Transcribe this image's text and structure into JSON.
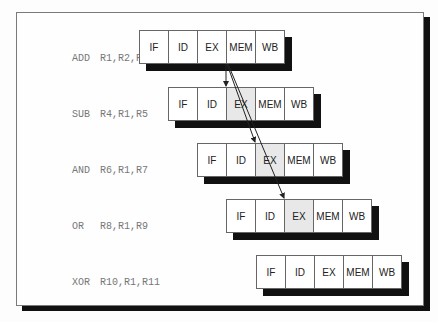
{
  "diagram": {
    "title": "",
    "stage_labels": [
      "IF",
      "ID",
      "EX",
      "MEM",
      "WB"
    ],
    "instructions": [
      {
        "op": "ADD",
        "operands": "R1,R2,R3",
        "stages": [
          "IF",
          "ID",
          "EX",
          "MEM",
          "WB"
        ],
        "highlight": null
      },
      {
        "op": "SUB",
        "operands": "R4,R1,R5",
        "stages": [
          "IF",
          "ID",
          "EX",
          "MEM",
          "WB"
        ],
        "highlight": "EX"
      },
      {
        "op": "AND",
        "operands": "R6,R1,R7",
        "stages": [
          "IF",
          "ID",
          "EX",
          "MEM",
          "WB"
        ],
        "highlight": "EX"
      },
      {
        "op": "OR",
        "operands": "R8,R1,R9",
        "stages": [
          "IF",
          "ID",
          "EX",
          "MEM",
          "WB"
        ],
        "highlight": "EX"
      },
      {
        "op": "XOR",
        "operands": "R10,R1,R11",
        "stages": [
          "IF",
          "ID",
          "EX",
          "MEM",
          "WB"
        ],
        "highlight": null
      }
    ],
    "forwarding_arrows": [
      {
        "from": "ADD.EX/MEM",
        "to": "SUB.EX"
      },
      {
        "from": "ADD.EX/MEM",
        "to": "AND.EX"
      },
      {
        "from": "ADD.EX/MEM",
        "to": "OR.EX"
      }
    ],
    "colors": {
      "highlight": "#e8e8e8",
      "shadow": "#111111",
      "border": "#666666",
      "label_text": "#777777"
    }
  }
}
